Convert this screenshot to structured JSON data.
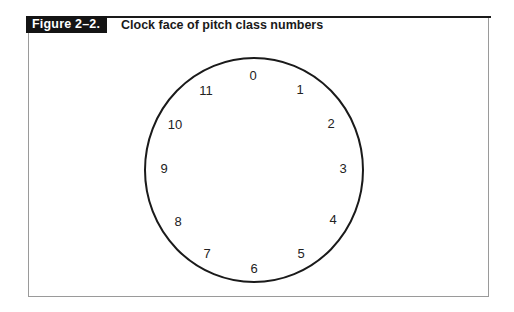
{
  "figure": {
    "label": "Figure 2–2.",
    "caption": "Clock face of pitch class numbers"
  },
  "diagram": {
    "type": "clock-face",
    "center": [
      254,
      170
    ],
    "radius_x": 109,
    "radius_y": 112,
    "stroke_color": "#1a1a1a",
    "numbers": [
      {
        "label": "0",
        "x": 253,
        "y": 75
      },
      {
        "label": "1",
        "x": 300,
        "y": 89
      },
      {
        "label": "2",
        "x": 331,
        "y": 123
      },
      {
        "label": "3",
        "x": 343,
        "y": 168
      },
      {
        "label": "4",
        "x": 333,
        "y": 219
      },
      {
        "label": "5",
        "x": 301,
        "y": 253
      },
      {
        "label": "6",
        "x": 254,
        "y": 268
      },
      {
        "label": "7",
        "x": 207,
        "y": 253
      },
      {
        "label": "8",
        "x": 178,
        "y": 221
      },
      {
        "label": "9",
        "x": 164,
        "y": 168
      },
      {
        "label": "10",
        "x": 175,
        "y": 124
      },
      {
        "label": "11",
        "x": 206,
        "y": 90
      }
    ]
  }
}
